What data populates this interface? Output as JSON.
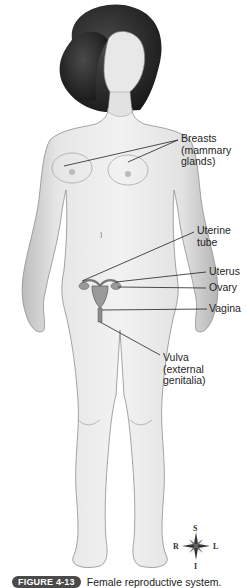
{
  "figure": {
    "number_label": "FIGURE 4-13",
    "caption": "Female reproductive system."
  },
  "labels": [
    {
      "id": "breasts",
      "text": "Breasts\n(mammary\nglands)"
    },
    {
      "id": "uterine-tube",
      "text": "Uterine\ntube"
    },
    {
      "id": "uterus",
      "text": "Uterus"
    },
    {
      "id": "ovary",
      "text": "Ovary"
    },
    {
      "id": "vagina",
      "text": "Vagina"
    },
    {
      "id": "vulva",
      "text": "Vulva\n(external\ngenitalia)"
    }
  ],
  "compass": {
    "superior": "S",
    "inferior": "I",
    "right": "R",
    "left": "L"
  },
  "colors": {
    "skin": "#ececec",
    "skin_shade": "#b8b8b8",
    "hair": "#2a2a2a",
    "leader_line": "#222222",
    "badge": "#4a4a4a"
  }
}
